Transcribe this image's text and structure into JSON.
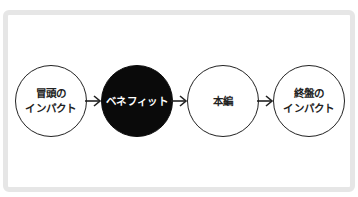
{
  "diagram": {
    "type": "flow",
    "direction": "left-to-right",
    "nodes": [
      {
        "id": "opening-impact",
        "label": "冒頭の\nインパクト",
        "style": "outline"
      },
      {
        "id": "benefit",
        "label": "ベネフィット",
        "style": "filled"
      },
      {
        "id": "main-body",
        "label": "本編",
        "style": "outline"
      },
      {
        "id": "closing-impact",
        "label": "終盤の\nインパクト",
        "style": "outline"
      }
    ],
    "edges": [
      {
        "from": "opening-impact",
        "to": "benefit"
      },
      {
        "from": "benefit",
        "to": "main-body"
      },
      {
        "from": "main-body",
        "to": "closing-impact"
      }
    ],
    "colors": {
      "frame_border": "#e6e6e6",
      "node_outline": "#222222",
      "node_filled": "#0a0a0a",
      "filled_text": "#ffffff",
      "text": "#222222"
    }
  }
}
